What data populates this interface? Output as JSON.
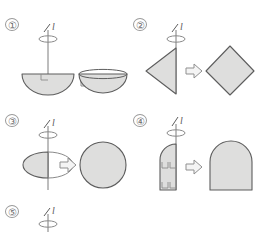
{
  "page": {
    "kind": "geometry-worksheet-figure",
    "background_color": "#ffffff",
    "shape_fill": "#dededd",
    "shape_stroke": "#5d5d5d",
    "axis_color": "#7d7d7d",
    "arrow_fill": "#f4f4f4",
    "arrow_stroke": "#8f8f8f"
  },
  "top_text_line": {
    "visible": "partially-cut-off",
    "fragments": [
      "",
      "",
      "",
      "",
      "",
      ""
    ]
  },
  "axis_label": "l",
  "arrow_glyph": "⇨",
  "items": [
    {
      "number": "①",
      "source_shape": "half-disc-flat-top",
      "result_shape": "hemispherical-bowl",
      "has_right_angle_mark": true
    },
    {
      "number": "②",
      "source_shape": "triangle-half-rhombus",
      "result_shape": "rhombus-bicone",
      "has_right_angle_mark": false
    },
    {
      "number": "③",
      "source_shape": "half-ellipse-semicircle",
      "result_shape": "sphere",
      "has_right_angle_mark": false
    },
    {
      "number": "④",
      "source_shape": "rectangle-with-rounded-top",
      "result_shape": "cylinder-with-dome-top",
      "has_right_angle_mark": true
    },
    {
      "number": "⑤",
      "source_shape": "cut-off",
      "result_shape": "cut-off",
      "has_right_angle_mark": false
    }
  ]
}
